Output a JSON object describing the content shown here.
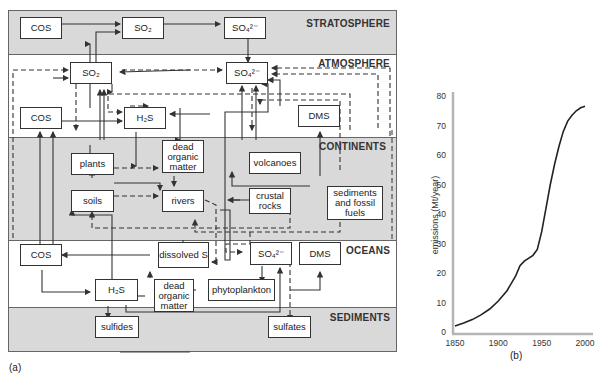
{
  "figure": {
    "panel_a_label": "(a)",
    "panel_b_label": "(b)"
  },
  "reservoirs": {
    "stratosphere": "STRATOSPHERE",
    "atmosphere": "ATMOSPHERE",
    "continents": "CONTINENTS",
    "oceans": "OCEANS",
    "sediments": "SEDIMENTS"
  },
  "boxes": {
    "strat_cos": "COS",
    "strat_so2": "SO₂",
    "strat_so4": "SO₄²⁻",
    "atm_so2": "SO₂",
    "atm_so4": "SO₄²⁻",
    "atm_cos": "COS",
    "atm_h2s": "H₂S",
    "atm_dms": "DMS",
    "cont_plants": "plants",
    "cont_dead_organic": "dead organic matter",
    "cont_volcanoes": "volcanoes",
    "cont_soils": "soils",
    "cont_rivers": "rivers",
    "cont_crustal_rocks": "crustal rocks",
    "cont_sediments_fossil": "sediments and fossil fuels",
    "ocean_cos": "COS",
    "ocean_dissolved_s": "dissolved S",
    "ocean_so4": "SO₄²⁻",
    "ocean_dms": "DMS",
    "ocean_h2s": "H₂S",
    "ocean_dead_organic": "dead organic matter",
    "ocean_phytoplankton": "phytoplankton",
    "sed_sulfides": "sulfides",
    "sed_sulfates": "sulfates"
  },
  "colors": {
    "band_gray": "#d9d9d9",
    "band_white": "#ffffff",
    "line": "#333333",
    "axis": "#b5b5b5"
  },
  "chart_data": {
    "type": "line",
    "title": "",
    "xlabel": "",
    "ylabel": "emissions (Mt/year)",
    "xlim": [
      1850,
      2000
    ],
    "ylim": [
      0,
      80
    ],
    "xticks": [
      1850,
      1900,
      1950,
      2000
    ],
    "yticks": [
      0,
      10,
      20,
      30,
      40,
      50,
      60,
      70,
      80
    ],
    "grid": false,
    "series": [
      {
        "name": "emissions",
        "x": [
          1850,
          1860,
          1870,
          1880,
          1890,
          1900,
          1910,
          1920,
          1925,
          1930,
          1940,
          1945,
          1950,
          1955,
          1960,
          1965,
          1970,
          1975,
          1980,
          1985,
          1990,
          1995,
          2000
        ],
        "values": [
          2,
          3,
          4.2,
          5.8,
          7.8,
          10.5,
          14,
          19,
          22.5,
          24,
          26,
          28,
          34,
          42,
          50,
          57,
          63,
          68,
          71.5,
          73.5,
          75,
          76,
          76.5
        ]
      }
    ]
  }
}
